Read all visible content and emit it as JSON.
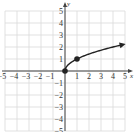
{
  "chart_data": {
    "type": "line",
    "title": "",
    "function": "y = sqrt(x)",
    "xlabel": "x",
    "ylabel": "y",
    "xlim": [
      -5,
      5
    ],
    "ylim": [
      -5,
      5
    ],
    "grid": true,
    "x_ticks": [
      "−5",
      "−4",
      "−3",
      "−2",
      "−1",
      "1",
      "2",
      "3",
      "4",
      "5"
    ],
    "y_ticks": [
      "5",
      "4",
      "3",
      "2",
      "1",
      "−1",
      "−2",
      "−3",
      "−4",
      "−5"
    ],
    "series": [
      {
        "name": "y = √x",
        "x": [
          0,
          0.25,
          0.5,
          1,
          1.5,
          2,
          2.5,
          3,
          3.5,
          4,
          4.5,
          5
        ],
        "y": [
          0,
          0.5,
          0.707,
          1,
          1.225,
          1.414,
          1.581,
          1.732,
          1.871,
          2,
          2.121,
          2.236
        ],
        "end_arrow": true
      }
    ],
    "marked_points": [
      {
        "x": 0,
        "y": 0
      },
      {
        "x": 1,
        "y": 1
      }
    ],
    "colors": {
      "grid": "#d9d9d9",
      "axis": "#444444",
      "curve": "#222222"
    }
  }
}
